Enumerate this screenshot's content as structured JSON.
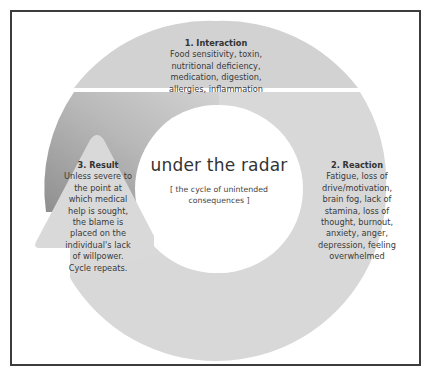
{
  "diagram": {
    "title": "under the radar",
    "subtitle": "[ the cycle of unintended consequences ]",
    "steps": [
      {
        "title": "1. Interaction",
        "body": "Food sensitivity, toxin, nutritional deficiency, medication, digestion, allergies, inflammation"
      },
      {
        "title": "2. Reaction",
        "body": "Fatigue, loss of drive/motivation, brain fog, lack of stamina, loss of thought, burnout, anxiety, anger, depression, feeling overwhelmed"
      },
      {
        "title": "3. Result",
        "body": "Unless severe to the point at which medical help is sought, the blame is placed on the individual's lack of willpower. Cycle repeats."
      }
    ],
    "colors": {
      "ring": "#d8d8d8",
      "ring_top": "#d3d3d3",
      "gradient_dark": "#9a9a9a",
      "gradient_light": "#cfcfcf",
      "arrow": "#d9d9d9",
      "frame": "#3c3c3c",
      "text": "#3a3a3a"
    }
  }
}
